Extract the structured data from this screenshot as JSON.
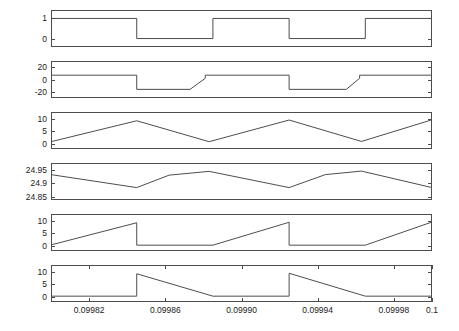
{
  "figure": {
    "title": "",
    "background": "#ffffff",
    "line_color": "#4d4d4d",
    "axis_color": "#4d4d4d"
  },
  "xaxis": {
    "label": "",
    "min": 0.0998,
    "max": 0.1,
    "ticks": [
      0.09982,
      0.09986,
      0.0999,
      0.09994,
      0.09998,
      0.1
    ],
    "tick_labels": [
      "0.09982",
      "0.09986",
      "0.09990",
      "0.09994",
      "0.09998",
      "0.1"
    ]
  },
  "chart_data": [
    {
      "type": "line",
      "title": "",
      "xlabel": "",
      "ylabel": "",
      "index": 1,
      "grid": false,
      "legend": false,
      "xlim": [
        0.0998,
        0.1
      ],
      "ylim": [
        -0.42,
        1.42
      ],
      "yticks": [
        0,
        1
      ],
      "ytick_labels": [
        "0",
        "1"
      ],
      "series": [
        {
          "name": "gate-signal",
          "waveform": "square",
          "x": [
            0.0998,
            0.099845,
            0.099845,
            0.099885,
            0.099885,
            0.099925,
            0.099925,
            0.099965,
            0.099965,
            0.100005,
            0.100005,
            0.100045,
            0.100045,
            0.100085,
            0.100085,
            0.1001
          ],
          "y": [
            1,
            1,
            0,
            0,
            1,
            1,
            0,
            0,
            1,
            1,
            0,
            0,
            1,
            1,
            0,
            0
          ]
        }
      ]
    },
    {
      "type": "line",
      "title": "",
      "xlabel": "",
      "ylabel": "",
      "index": 2,
      "grid": false,
      "legend": false,
      "xlim": [
        0.0998,
        0.1
      ],
      "ylim": [
        -30,
        30
      ],
      "yticks": [
        -20,
        0,
        20
      ],
      "ytick_labels": [
        "-20",
        "0",
        "20"
      ],
      "series": [
        {
          "name": "current-signal",
          "waveform": "stepped-ramp",
          "x": [
            0.0998,
            0.099845,
            0.099845,
            0.099873,
            0.099881,
            0.099881,
            0.099925,
            0.099925,
            0.099955,
            0.099962,
            0.099962,
            0.100005,
            0.100005,
            0.100035,
            0.100043,
            0.100043,
            0.100085,
            0.100085,
            0.100116,
            0.100122,
            0.100122,
            0.1001
          ],
          "y": [
            7,
            7,
            -16,
            -16,
            2,
            7,
            7,
            -16,
            -16,
            2,
            7,
            7,
            -16,
            -16,
            2,
            7,
            7,
            -16,
            -16,
            2,
            7,
            7
          ]
        }
      ]
    },
    {
      "type": "line",
      "title": "",
      "xlabel": "",
      "ylabel": "",
      "index": 3,
      "grid": false,
      "legend": false,
      "xlim": [
        0.0998,
        0.1
      ],
      "ylim": [
        -2.2,
        13.0
      ],
      "yticks": [
        0,
        5,
        10
      ],
      "ytick_labels": [
        "0",
        "5",
        "10"
      ],
      "series": [
        {
          "name": "triangle-signal",
          "waveform": "triangle",
          "x": [
            0.0998,
            0.099845,
            0.099883,
            0.099925,
            0.099963,
            0.100005,
            0.100043,
            0.100085,
            0.100123,
            0.1001
          ],
          "y": [
            0.8,
            9.4,
            0.8,
            9.7,
            0.9,
            9.8,
            0.9,
            9.9,
            0.9,
            9.9
          ]
        }
      ]
    },
    {
      "type": "line",
      "title": "",
      "xlabel": "",
      "ylabel": "",
      "index": 4,
      "grid": false,
      "legend": false,
      "xlim": [
        0.0998,
        0.1
      ],
      "ylim": [
        24.838,
        24.975
      ],
      "yticks": [
        24.85,
        24.9,
        24.95
      ],
      "ytick_labels": [
        "24.85",
        "24.9",
        "24.95"
      ],
      "series": [
        {
          "name": "capacitor-voltage",
          "waveform": "ripple",
          "x": [
            0.0998,
            0.099845,
            0.099862,
            0.099883,
            0.099925,
            0.099944,
            0.099963,
            0.100005,
            0.100024,
            0.100043,
            0.100085,
            0.100104,
            0.100123,
            0.1001
          ],
          "y": [
            24.932,
            24.884,
            24.93,
            24.944,
            24.884,
            24.932,
            24.945,
            24.884,
            24.934,
            24.947,
            24.886,
            24.936,
            24.948,
            24.94
          ]
        }
      ]
    },
    {
      "type": "line",
      "title": "",
      "xlabel": "",
      "ylabel": "",
      "index": 5,
      "grid": false,
      "legend": false,
      "xlim": [
        0.0998,
        0.1
      ],
      "ylim": [
        -2.2,
        13.0
      ],
      "yticks": [
        0,
        5,
        10
      ],
      "ytick_labels": [
        "0",
        "5",
        "10"
      ],
      "series": [
        {
          "name": "inductor-current-rising",
          "waveform": "sawtooth-rising",
          "x": [
            0.0998,
            0.099845,
            0.099845,
            0.099885,
            0.099925,
            0.099925,
            0.099965,
            0.100005,
            0.100005,
            0.100045,
            0.100085,
            0.100085,
            0.1001
          ],
          "y": [
            0.3,
            9.4,
            0.2,
            0.2,
            9.6,
            0.2,
            0.2,
            9.7,
            0.2,
            0.2,
            9.8,
            0.2,
            0.2
          ]
        }
      ]
    },
    {
      "type": "line",
      "title": "",
      "xlabel": "",
      "ylabel": "",
      "index": 6,
      "grid": false,
      "legend": false,
      "xlim": [
        0.0998,
        0.1
      ],
      "ylim": [
        -2.2,
        13.0
      ],
      "yticks": [
        0,
        5,
        10
      ],
      "ytick_labels": [
        "0",
        "5",
        "10"
      ],
      "series": [
        {
          "name": "diode-current-falling",
          "waveform": "sawtooth-falling",
          "x": [
            0.0998,
            0.099845,
            0.099845,
            0.099885,
            0.099925,
            0.099925,
            0.099925,
            0.099965,
            0.100005,
            0.100005,
            0.100005,
            0.100045,
            0.100085,
            0.100085,
            0.100085,
            0.100125,
            0.1001
          ],
          "y": [
            0.2,
            0.2,
            9.4,
            0.2,
            0.2,
            0.2,
            9.6,
            0.2,
            0.2,
            0.2,
            9.7,
            0.2,
            0.2,
            0.2,
            9.8,
            0.2,
            0.2
          ]
        }
      ]
    }
  ]
}
